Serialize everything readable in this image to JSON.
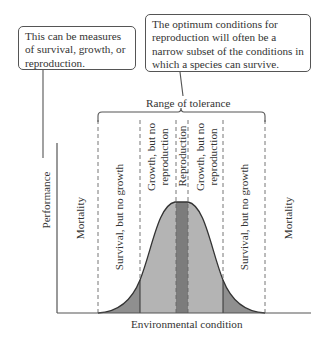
{
  "callouts": {
    "left": "This can be measures of survival, growth, or reproduction.",
    "right": "The optimum conditions for reproduction will often be a narrow subset of the conditions in which a species can survive."
  },
  "range_label": "Range of tolerance",
  "axes": {
    "y_label": "Performance",
    "x_label": "Environmental condition"
  },
  "zones": [
    {
      "id": "mortality-left",
      "label": "Mortality"
    },
    {
      "id": "survival-left",
      "label": "Survival, but no growth"
    },
    {
      "id": "growth-left",
      "line1": "Growth, but no",
      "line2": "reproduction"
    },
    {
      "id": "reproduction",
      "label": "Reproduction"
    },
    {
      "id": "growth-right",
      "line1": "Growth, but no",
      "line2": "reproduction"
    },
    {
      "id": "survival-right",
      "label": "Survival, but no growth"
    },
    {
      "id": "mortality-right",
      "label": "Mortality"
    }
  ],
  "colors": {
    "survival_fill": "#8f8f8f",
    "growth_fill": "#b4b4b4",
    "reproduction_fill": "#7c7c7c",
    "line": "#333333"
  }
}
